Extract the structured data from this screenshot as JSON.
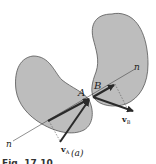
{
  "figure": {
    "subfigure_label": "(a)",
    "caption_partial": "Fig. 17.10",
    "colors": {
      "body_fill": "#bdbdbd",
      "body_stroke": "#555555",
      "arrow": "#2a2a2a",
      "thin_line": "#444444",
      "background": "#ffffff"
    },
    "bodies": [
      {
        "name": "body-A",
        "point_label": "A"
      },
      {
        "name": "body-B",
        "point_label": "B"
      }
    ],
    "normal_line": {
      "label_start": "n",
      "label_end": "n"
    },
    "vectors": [
      {
        "name": "velocity-A",
        "label": "v",
        "subscript": "A"
      },
      {
        "name": "velocity-B",
        "label": "v",
        "subscript": "B"
      }
    ]
  }
}
